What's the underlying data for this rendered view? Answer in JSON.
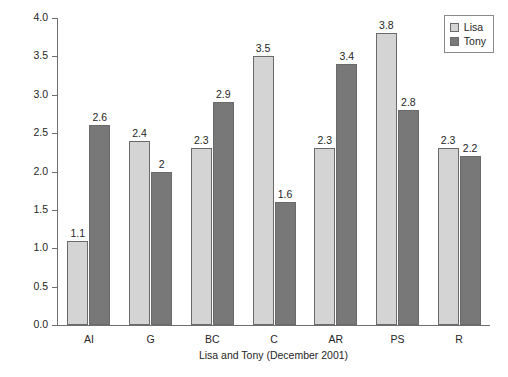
{
  "chart_data": {
    "type": "bar",
    "title": "",
    "subtitle": "",
    "xlabel": "Lisa and Tony (December 2001)",
    "ylabel": "",
    "categories": [
      "AI",
      "G",
      "BC",
      "C",
      "AR",
      "PS",
      "R"
    ],
    "series": [
      {
        "name": "Lisa",
        "color": "#d4d4d4",
        "values": [
          1.1,
          2.4,
          2.3,
          3.5,
          2.3,
          3.8,
          2.3
        ],
        "value_labels": [
          "1.1",
          "2.4",
          "2.3",
          "3.5",
          "2.3",
          "3.8",
          "2.3"
        ]
      },
      {
        "name": "Tony",
        "color": "#787878",
        "values": [
          2.6,
          2.0,
          2.9,
          1.6,
          3.4,
          2.8,
          2.2
        ],
        "value_labels": [
          "2.6",
          "2",
          "2.9",
          "1.6",
          "3.4",
          "2.8",
          "2.2"
        ]
      }
    ],
    "ylim": [
      0.0,
      4.0
    ],
    "ytick_labels": [
      "0.0",
      "0.5",
      "1.0",
      "1.5",
      "2.0",
      "2.5",
      "3.0",
      "3.5",
      "4.0"
    ],
    "ytick_values": [
      0.0,
      0.5,
      1.0,
      1.5,
      2.0,
      2.5,
      3.0,
      3.5,
      4.0
    ],
    "grid": false,
    "legend_position": "top-right",
    "show_value_labels": true,
    "bar_border_color": "#6a6a6a",
    "axis_color": "#6e6e6e"
  },
  "legend": {
    "entries": [
      {
        "label": "Lisa",
        "swatch": "legend-swatch-lisa"
      },
      {
        "label": "Tony",
        "swatch": "legend-swatch-tony"
      }
    ]
  },
  "axis": {
    "x_title": "Lisa and Tony (December 2001)"
  }
}
